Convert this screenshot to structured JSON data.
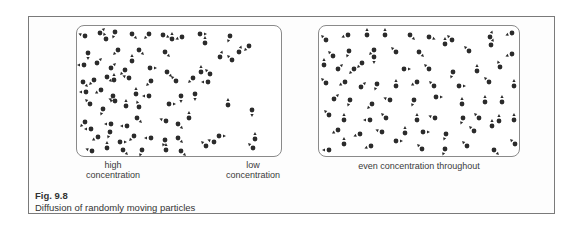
{
  "figure": {
    "number": "Fig. 9.8",
    "caption": "Diffusion of randomly moving particles"
  },
  "panels": [
    {
      "id": "left",
      "labels": [
        {
          "text": "high\nconcentration",
          "line1": "high",
          "line2": "concentration"
        },
        {
          "text": "low\nconcentration",
          "line1": "low",
          "line2": "concentration"
        }
      ],
      "particles": [
        [
          8,
          10,
          200
        ],
        [
          23,
          7,
          315
        ],
        [
          38,
          6,
          110
        ],
        [
          55,
          8,
          45
        ],
        [
          72,
          8,
          135
        ],
        [
          86,
          9,
          20
        ],
        [
          105,
          11,
          160
        ],
        [
          123,
          8,
          0
        ],
        [
          153,
          10,
          110
        ],
        [
          172,
          20,
          135
        ],
        [
          11,
          27,
          90
        ],
        [
          29,
          13,
          250
        ],
        [
          41,
          24,
          135
        ],
        [
          62,
          24,
          45
        ],
        [
          88,
          26,
          45
        ],
        [
          95,
          13,
          270
        ],
        [
          128,
          17,
          270
        ],
        [
          143,
          31,
          290
        ],
        [
          155,
          34,
          225
        ],
        [
          7,
          39,
          180
        ],
        [
          20,
          37,
          315
        ],
        [
          34,
          42,
          315
        ],
        [
          48,
          44,
          135
        ],
        [
          55,
          35,
          270
        ],
        [
          73,
          42,
          0
        ],
        [
          90,
          46,
          45
        ],
        [
          124,
          46,
          270
        ],
        [
          162,
          26,
          290
        ],
        [
          6,
          56,
          45
        ],
        [
          17,
          54,
          135
        ],
        [
          30,
          51,
          45
        ],
        [
          37,
          54,
          270
        ],
        [
          52,
          52,
          200
        ],
        [
          74,
          55,
          135
        ],
        [
          99,
          55,
          225
        ],
        [
          116,
          52,
          135
        ],
        [
          133,
          48,
          225
        ],
        [
          9,
          66,
          180
        ],
        [
          24,
          64,
          150
        ],
        [
          36,
          70,
          110
        ],
        [
          59,
          68,
          270
        ],
        [
          72,
          70,
          180
        ],
        [
          104,
          70,
          90
        ],
        [
          118,
          68,
          90
        ],
        [
          131,
          56,
          180
        ],
        [
          13,
          78,
          225
        ],
        [
          26,
          83,
          110
        ],
        [
          38,
          75,
          200
        ],
        [
          49,
          80,
          270
        ],
        [
          62,
          81,
          250
        ],
        [
          92,
          78,
          0
        ],
        [
          151,
          79,
          270
        ],
        [
          175,
          84,
          90
        ],
        [
          8,
          96,
          135
        ],
        [
          14,
          103,
          180
        ],
        [
          34,
          98,
          180
        ],
        [
          50,
          100,
          180
        ],
        [
          60,
          92,
          45
        ],
        [
          89,
          95,
          200
        ],
        [
          101,
          98,
          45
        ],
        [
          112,
          92,
          270
        ],
        [
          21,
          111,
          150
        ],
        [
          33,
          106,
          110
        ],
        [
          43,
          116,
          0
        ],
        [
          57,
          110,
          135
        ],
        [
          74,
          112,
          180
        ],
        [
          88,
          114,
          110
        ],
        [
          101,
          112,
          45
        ],
        [
          137,
          116,
          200
        ],
        [
          178,
          113,
          270
        ],
        [
          15,
          125,
          200
        ],
        [
          30,
          122,
          270
        ],
        [
          46,
          124,
          45
        ],
        [
          65,
          124,
          110
        ],
        [
          89,
          124,
          270
        ],
        [
          104,
          125,
          45
        ],
        [
          129,
          120,
          225
        ],
        [
          142,
          110,
          0
        ],
        [
          176,
          122,
          225
        ]
      ]
    },
    {
      "id": "right",
      "labels": [
        {
          "text": "even concentration throughout",
          "line1": "even concentration throughout",
          "line2": ""
        }
      ],
      "particles": [
        [
          7,
          14,
          225
        ],
        [
          29,
          9,
          160
        ],
        [
          48,
          9,
          270
        ],
        [
          66,
          9,
          270
        ],
        [
          91,
          9,
          45
        ],
        [
          110,
          11,
          20
        ],
        [
          133,
          14,
          225
        ],
        [
          171,
          11,
          290
        ],
        [
          193,
          7,
          160
        ],
        [
          14,
          30,
          225
        ],
        [
          30,
          25,
          110
        ],
        [
          55,
          24,
          135
        ],
        [
          77,
          26,
          225
        ],
        [
          100,
          26,
          45
        ],
        [
          126,
          18,
          270
        ],
        [
          150,
          25,
          225
        ],
        [
          172,
          19,
          290
        ],
        [
          193,
          28,
          160
        ],
        [
          5,
          39,
          270
        ],
        [
          19,
          43,
          315
        ],
        [
          35,
          43,
          135
        ],
        [
          43,
          37,
          135
        ],
        [
          55,
          31,
          90
        ],
        [
          85,
          43,
          0
        ],
        [
          110,
          43,
          225
        ],
        [
          134,
          46,
          110
        ],
        [
          158,
          45,
          270
        ],
        [
          181,
          41,
          250
        ],
        [
          7,
          57,
          225
        ],
        [
          26,
          56,
          150
        ],
        [
          42,
          61,
          315
        ],
        [
          58,
          58,
          110
        ],
        [
          77,
          60,
          270
        ],
        [
          98,
          56,
          150
        ],
        [
          115,
          60,
          225
        ],
        [
          140,
          60,
          0
        ],
        [
          170,
          56,
          225
        ],
        [
          195,
          60,
          270
        ],
        [
          15,
          73,
          315
        ],
        [
          31,
          74,
          110
        ],
        [
          53,
          78,
          135
        ],
        [
          71,
          74,
          200
        ],
        [
          95,
          74,
          110
        ],
        [
          117,
          71,
          0
        ],
        [
          143,
          78,
          270
        ],
        [
          166,
          76,
          270
        ],
        [
          183,
          76,
          270
        ],
        [
          10,
          89,
          225
        ],
        [
          25,
          94,
          270
        ],
        [
          51,
          94,
          180
        ],
        [
          67,
          92,
          225
        ],
        [
          98,
          94,
          270
        ],
        [
          116,
          92,
          200
        ],
        [
          144,
          92,
          110
        ],
        [
          160,
          92,
          225
        ],
        [
          180,
          95,
          270
        ],
        [
          195,
          94,
          270
        ],
        [
          19,
          104,
          150
        ],
        [
          41,
          108,
          160
        ],
        [
          63,
          106,
          200
        ],
        [
          86,
          107,
          270
        ],
        [
          104,
          106,
          0
        ],
        [
          127,
          108,
          110
        ],
        [
          155,
          105,
          225
        ],
        [
          173,
          100,
          270
        ],
        [
          10,
          124,
          180
        ],
        [
          25,
          118,
          270
        ],
        [
          52,
          120,
          160
        ],
        [
          77,
          115,
          0
        ],
        [
          103,
          123,
          225
        ],
        [
          126,
          123,
          110
        ],
        [
          148,
          120,
          225
        ],
        [
          175,
          124,
          45
        ],
        [
          196,
          118,
          225
        ]
      ]
    }
  ],
  "colors": {
    "particle": "#2b2b2b",
    "frame_border": "#7a7a7a",
    "panel_border": "#8a8a8a",
    "text": "#3a3a3a"
  }
}
